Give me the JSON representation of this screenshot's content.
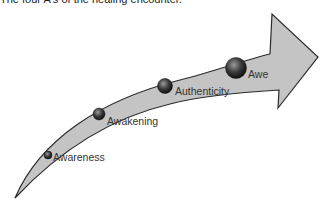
{
  "title": "The four A's of the healing encounter.",
  "diagram": {
    "type": "curved-arrow-stages",
    "colors": {
      "arrow_fill": "#c4c4c4",
      "arrow_stroke": "#2a2a2a",
      "sphere_dark": "#1e1e1e",
      "sphere_light": "#9a9a9a"
    },
    "stages": [
      {
        "label": "Awareness"
      },
      {
        "label": "Awakening"
      },
      {
        "label": "Authenticity"
      },
      {
        "label": "Awe"
      }
    ]
  }
}
